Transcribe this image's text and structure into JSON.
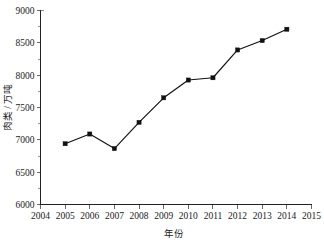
{
  "chart_data": {
    "type": "line",
    "title": "",
    "xlabel": "年份",
    "ylabel": "肉类 / 万吨",
    "x": [
      2005,
      2006,
      2007,
      2008,
      2009,
      2010,
      2011,
      2012,
      2013,
      2014
    ],
    "values": [
      6940,
      7090,
      6865,
      7270,
      7650,
      7925,
      7960,
      8390,
      8535,
      8710
    ],
    "series": [
      {
        "name": "肉类产量",
        "values": [
          6940,
          7090,
          6865,
          7270,
          7650,
          7925,
          7960,
          8390,
          8535,
          8710
        ]
      }
    ],
    "xlim": [
      2004,
      2015
    ],
    "ylim": [
      6000,
      9000
    ],
    "x_ticks": [
      2004,
      2005,
      2006,
      2007,
      2008,
      2009,
      2010,
      2011,
      2012,
      2013,
      2014,
      2015
    ],
    "x_tick_labels": [
      "2004",
      "2005",
      "2006",
      "2007",
      "2008",
      "2009",
      "2010",
      "2011",
      "2012",
      "2013",
      "2014",
      "2015"
    ],
    "y_ticks": [
      6000,
      6500,
      7000,
      7500,
      8000,
      8500,
      9000
    ],
    "y_tick_labels": [
      "6000",
      "6500",
      "7000",
      "7500",
      "8000",
      "8500",
      "9000"
    ],
    "y_minor_ticks": [
      6250,
      6750,
      7250,
      7750,
      8250,
      8750
    ],
    "grid": false,
    "legend": false,
    "legend_position": "none",
    "marker": "square",
    "line_color": "#111111",
    "marker_color": "#111111",
    "background_color": "#ffffff",
    "spines": [
      "left",
      "bottom"
    ]
  },
  "axes": {
    "x_title": "年份",
    "y_title": "肉类 / 万吨"
  }
}
